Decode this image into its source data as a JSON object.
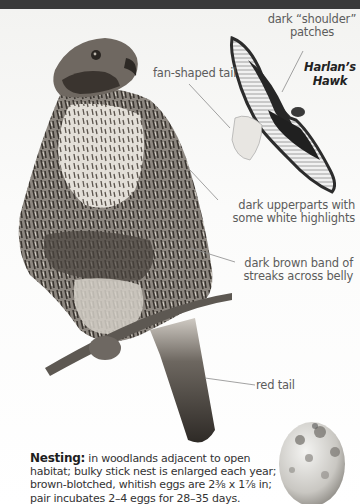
{
  "page": {
    "background": "#ffffff",
    "top_bar_color": "#3a3a3a"
  },
  "illustration": {
    "subject": "Red-tailed Hawk, perched (dark morph)",
    "inset_subject": "Harlan's Hawk in flight",
    "egg": "brown-blotched whitish egg"
  },
  "labels": {
    "shoulder": "dark “shoulder” patches",
    "shoulder_line1": "dark “shoulder”",
    "shoulder_line2": "patches",
    "tail_fan": "fan-shaped tail",
    "variant_line1": "Harlan’s",
    "variant_line2": "Hawk",
    "upperparts_line1": "dark upperparts with",
    "upperparts_line2": "some white highlights",
    "belly_line1": "dark brown band of",
    "belly_line2": "streaks across belly",
    "red_tail": "red tail"
  },
  "nesting": {
    "heading": "Nesting:",
    "text": " in woodlands adjacent to open habitat; bulky stick nest is enlarged each year; brown-blotched, whitish eggs are 2⅜ x 1⅞ in; pair incubates 2–4 eggs for 28–35 days."
  },
  "colors": {
    "label_text": "#5c5c5c",
    "leader_line": "#8a8a8a",
    "body_text": "#333333"
  }
}
